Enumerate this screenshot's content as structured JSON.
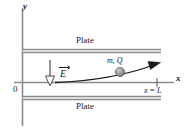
{
  "figure": {
    "background_color": "#ffffff",
    "ink_color": "#1a1a1a",
    "plate_color": "#8c8c8c",
    "particle_color": "#8f8f8f",
    "width": 190,
    "height": 133
  },
  "axes": {
    "y_label": "y",
    "x_label": "x",
    "origin_label": "0",
    "x_axis_y": 82,
    "y_axis_x": 22,
    "tick_x": 157
  },
  "plates": {
    "top_label": "Plate",
    "bottom_label": "Plate",
    "top_y": 50,
    "bottom_y": 97,
    "x_start": 22,
    "x_end": 161
  },
  "field": {
    "label": "E",
    "vector_notation": "arrow-over",
    "direction": "down",
    "arrow_x": 50,
    "arrow_y_start": 60,
    "arrow_y_end": 85
  },
  "particle": {
    "label": "m, Q",
    "mass_symbol": "m",
    "charge_symbol": "Q",
    "center_x": 120,
    "center_y": 72,
    "radius": 4.5
  },
  "trajectory": {
    "start_x": 55,
    "start_y": 82,
    "end_x": 158,
    "end_y": 63,
    "shape": "parabolic-deflection",
    "arrowhead": "end"
  },
  "markers": {
    "exit_label": "x = L",
    "exit_x": 157
  }
}
